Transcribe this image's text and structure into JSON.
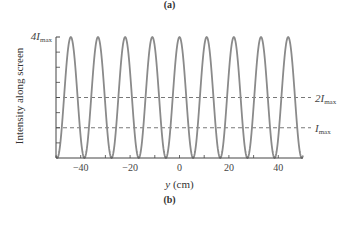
{
  "panel_labels": {
    "top": "(a)",
    "bottom": "(b)"
  },
  "chart_data": {
    "type": "line",
    "title": "",
    "xlabel": "y (cm)",
    "ylabel": "Intensity along screen",
    "xlim": [
      -50,
      50
    ],
    "ylim": [
      0,
      4
    ],
    "x_ticks": [
      -40,
      -20,
      0,
      20,
      40
    ],
    "x_tick_labels": [
      "−40",
      "−20",
      "0",
      "20",
      "40"
    ],
    "y_tick_labels": [
      {
        "value": 4,
        "label": "4I",
        "sub": "max"
      }
    ],
    "period_cm": 11,
    "peaks_cm": [
      -44,
      -33,
      -22,
      -11,
      0,
      11,
      22,
      33,
      44
    ],
    "peak_value": 4,
    "min_value": 0,
    "function": "I = 4 Imax cos^2(pi*y/11)",
    "reference_lines": [
      {
        "value": 2,
        "label": "2I",
        "sub": "max",
        "style": "dashed"
      },
      {
        "value": 1,
        "label": "I",
        "sub": "max",
        "style": "dashed"
      }
    ],
    "grid": false,
    "line_color": "#8a8a8a"
  }
}
